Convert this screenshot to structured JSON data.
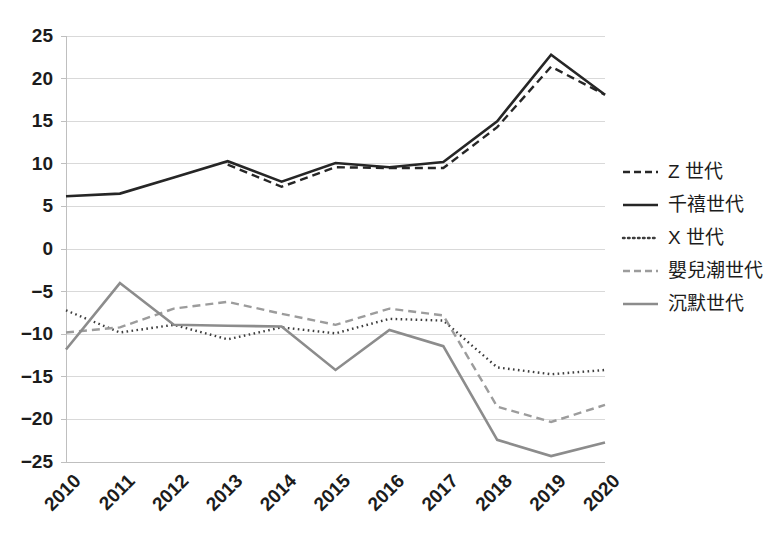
{
  "chart_data": {
    "type": "line",
    "title": "",
    "subtitle": "",
    "xlabel": "",
    "ylabel": "",
    "grid": true,
    "legend_position": "right",
    "categories": [
      "2010",
      "2011",
      "2012",
      "2013",
      "2014",
      "2015",
      "2016",
      "2017",
      "2018",
      "2019",
      "2020"
    ],
    "x": [
      2010,
      2011,
      2012,
      2013,
      2014,
      2015,
      2016,
      2017,
      2018,
      2019,
      2020
    ],
    "xlim": [
      2010,
      2020
    ],
    "ylim": [
      -25,
      25
    ],
    "ytick_labels": [
      "25",
      "20",
      "15",
      "10",
      "5",
      "0",
      "-5",
      "-10",
      "-15",
      "-20",
      "-25"
    ],
    "ytick_values": [
      25,
      20,
      15,
      10,
      5,
      0,
      -5,
      -10,
      -15,
      -20,
      -25
    ],
    "series": [
      {
        "name": "Z 世代",
        "style": "dashed",
        "color": "#262626",
        "width": 2.4,
        "values": [
          null,
          null,
          null,
          9.9,
          7.3,
          9.6,
          9.5,
          9.5,
          14.3,
          21.4,
          18.1
        ]
      },
      {
        "name": "千禧世代",
        "style": "solid",
        "color": "#262626",
        "width": 2.6,
        "values": [
          6.2,
          6.5,
          8.4,
          10.3,
          7.9,
          10.1,
          9.6,
          10.2,
          15.0,
          22.8,
          18.1
        ]
      },
      {
        "name": "X 世代",
        "style": "dotted",
        "color": "#3d3d3d",
        "width": 2.4,
        "values": [
          -7.2,
          -9.8,
          -8.9,
          -10.6,
          -9.2,
          -9.9,
          -8.2,
          -8.4,
          -13.9,
          -14.7,
          -14.2
        ]
      },
      {
        "name": "嬰兒潮世代",
        "style": "dashed",
        "color": "#9c9c9c",
        "width": 2.4,
        "values": [
          -9.8,
          -9.2,
          -7.0,
          -6.2,
          -7.6,
          -8.9,
          -7.0,
          -7.8,
          -18.5,
          -20.3,
          -18.3
        ]
      },
      {
        "name": "沉默世代",
        "style": "solid",
        "color": "#8c8c8c",
        "width": 2.6,
        "values": [
          -11.8,
          -4.0,
          -8.9,
          -9.0,
          -9.1,
          -14.2,
          -9.5,
          -11.4,
          -22.4,
          -24.3,
          -22.7
        ]
      }
    ]
  },
  "legend": {
    "items": [
      {
        "label": "Z 世代"
      },
      {
        "label": "千禧世代"
      },
      {
        "label": "X 世代"
      },
      {
        "label": "嬰兒潮世代"
      },
      {
        "label": "沉默世代"
      }
    ]
  },
  "axes": {
    "y_ticks": [
      {
        "label": "25"
      },
      {
        "label": "20"
      },
      {
        "label": "15"
      },
      {
        "label": "10"
      },
      {
        "label": "5"
      },
      {
        "label": "0"
      },
      {
        "label": "−5"
      },
      {
        "label": "−10"
      },
      {
        "label": "−15"
      },
      {
        "label": "−20"
      },
      {
        "label": "−25"
      }
    ],
    "x_ticks": [
      {
        "label": "2010"
      },
      {
        "label": "2011"
      },
      {
        "label": "2012"
      },
      {
        "label": "2013"
      },
      {
        "label": "2014"
      },
      {
        "label": "2015"
      },
      {
        "label": "2016"
      },
      {
        "label": "2017"
      },
      {
        "label": "2018"
      },
      {
        "label": "2019"
      },
      {
        "label": "2020"
      }
    ]
  },
  "colors": {
    "background": "#ffffff",
    "gridline": "#d9d9d9",
    "axis": "#bfbfbf",
    "text": "#1c1c1c",
    "dark_series": "#262626",
    "gray_series": "#8c8c8c"
  }
}
